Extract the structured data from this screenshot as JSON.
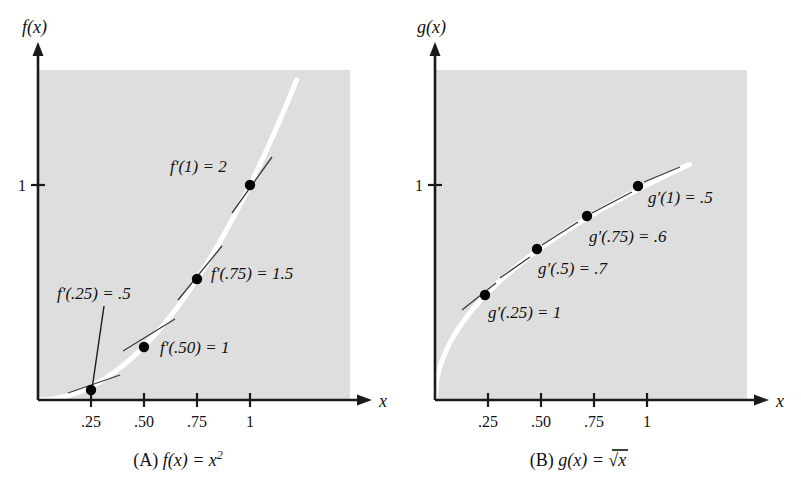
{
  "figure": {
    "background": "#ffffff",
    "panel_fill": "#dedede",
    "curve_color": "#ffffff",
    "axis_color": "#1a1a1a",
    "point_color": "#000000"
  },
  "chart_data": [
    {
      "type": "line",
      "panel_id": "A",
      "title": "(A)  f(x) = x²",
      "function": "f(x) = x^2",
      "xlabel": "x",
      "ylabel": "f(x)",
      "xlim": [
        0,
        1.2
      ],
      "ylim": [
        0,
        1.45
      ],
      "grid": false,
      "x_ticks": [
        ".25",
        ".50",
        ".75",
        "1"
      ],
      "x_tick_values": [
        0.25,
        0.5,
        0.75,
        1
      ],
      "y_ticks": [
        "1"
      ],
      "y_tick_values": [
        1
      ],
      "x": [
        0.25,
        0.5,
        0.75,
        1
      ],
      "values": [
        0.0625,
        0.25,
        0.5625,
        1
      ],
      "annotations": [
        {
          "id": "fp25",
          "text_plain": "f′(.25) = .5",
          "x": 0.25,
          "y": 0.0625,
          "derivative": 0.5,
          "leader_line": true
        },
        {
          "id": "fp50",
          "text_plain": "f′(.50) = 1",
          "x": 0.5,
          "y": 0.25,
          "derivative": 1,
          "leader_line": false
        },
        {
          "id": "fp75",
          "text_plain": "f′(.75) = 1.5",
          "x": 0.75,
          "y": 0.5625,
          "derivative": 1.5,
          "leader_line": false
        },
        {
          "id": "fp1",
          "text_plain": "f′(1) = 2",
          "x": 1,
          "y": 1,
          "derivative": 2,
          "leader_line": false
        }
      ]
    },
    {
      "type": "line",
      "panel_id": "B",
      "title": "(B)  g(x) = √x",
      "function": "g(x) = sqrt(x)",
      "xlabel": "x",
      "ylabel": "g(x)",
      "xlim": [
        0,
        1.2
      ],
      "ylim": [
        0,
        1.45
      ],
      "grid": false,
      "x_ticks": [
        ".25",
        ".50",
        ".75",
        "1"
      ],
      "x_tick_values": [
        0.25,
        0.5,
        0.75,
        1
      ],
      "y_ticks": [
        "1"
      ],
      "y_tick_values": [
        1
      ],
      "x": [
        0.25,
        0.5,
        0.75,
        1
      ],
      "values": [
        0.5,
        0.7071,
        0.866,
        1
      ],
      "annotations": [
        {
          "id": "gp25",
          "text_plain": "g′(.25) = 1",
          "x": 0.25,
          "y": 0.5,
          "derivative": 1,
          "leader_line": false
        },
        {
          "id": "gp50",
          "text_plain": "g′(.5) = .7",
          "x": 0.5,
          "y": 0.7071,
          "derivative": 0.7,
          "leader_line": false
        },
        {
          "id": "gp75",
          "text_plain": "g′(.75) = .6",
          "x": 0.75,
          "y": 0.866,
          "derivative": 0.6,
          "leader_line": false
        },
        {
          "id": "gp1",
          "text_plain": "g′(1) = .5",
          "x": 1,
          "y": 1,
          "derivative": 0.5,
          "leader_line": false
        }
      ]
    }
  ],
  "panel_a": {
    "y_axis_label": "f(x)",
    "x_axis_label": "x",
    "y_tick_1": "1",
    "x_tick_25": ".25",
    "x_tick_50": ".50",
    "x_tick_75": ".75",
    "x_tick_1": "1",
    "ann_fp25_fn": "f",
    "ann_fp25_rest": "′(.25) = .5",
    "ann_fp50_fn": "f",
    "ann_fp50_rest": "′(.50) = 1",
    "ann_fp75_fn": "f",
    "ann_fp75_rest": "′(.75) = 1.5",
    "ann_fp1_fn": "f",
    "ann_fp1_rest": "′(1) = 2",
    "caption_tag": "(A)",
    "caption_fn": "f",
    "caption_body": "(x) = x",
    "caption_exp": "2"
  },
  "panel_b": {
    "y_axis_label": "g(x)",
    "x_axis_label": "x",
    "y_tick_1": "1",
    "x_tick_25": ".25",
    "x_tick_50": ".50",
    "x_tick_75": ".75",
    "x_tick_1": "1",
    "ann_gp25_fn": "g",
    "ann_gp25_rest": "′(.25) = 1",
    "ann_gp50_fn": "g",
    "ann_gp50_rest": "′(.5) = .7",
    "ann_gp75_fn": "g",
    "ann_gp75_rest": "′(.75) = .6",
    "ann_gp1_fn": "g",
    "ann_gp1_rest": "′(1) = .5",
    "caption_tag": "(B)",
    "caption_fn": "g",
    "caption_body": "(x) = ",
    "caption_sqrt": "√",
    "caption_radicand": "x"
  }
}
